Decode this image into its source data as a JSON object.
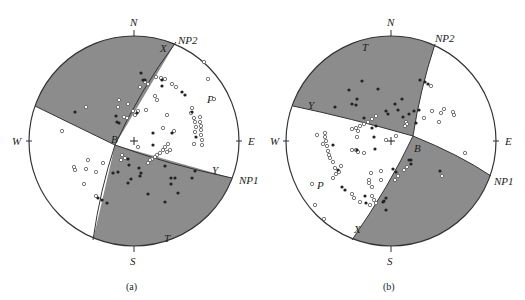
{
  "figure": {
    "panels": [
      {
        "id": "a",
        "caption": "(a)",
        "directions": {
          "north": "N",
          "south": "S",
          "east": "E",
          "west": "W"
        },
        "nodal_planes": {
          "np1": "NP1",
          "np2": "NP2"
        },
        "axes": {
          "p": "P",
          "t": "T",
          "b": "B",
          "x": "X",
          "y": "Y"
        }
      },
      {
        "id": "b",
        "caption": "(b)",
        "directions": {
          "north": "N",
          "south": "S",
          "east": "E",
          "west": "W"
        },
        "nodal_planes": {
          "np1": "NP1",
          "np2": "NP2"
        },
        "axes": {
          "p": "P",
          "t": "T",
          "b": "B",
          "x": "X",
          "y": "Y"
        }
      }
    ],
    "colors": {
      "shaded_quadrant": "#8c8c8c",
      "outline": "#333333",
      "background": "#ffffff",
      "filled_marker": "#222222",
      "open_marker_stroke": "#555555"
    }
  }
}
